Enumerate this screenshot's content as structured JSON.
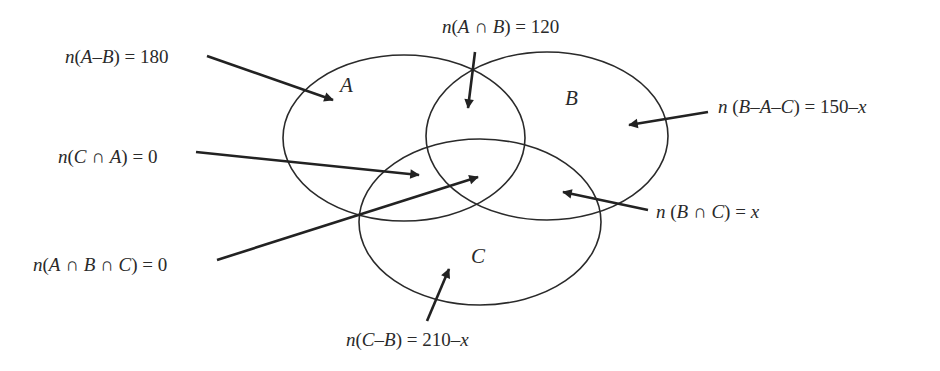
{
  "diagram": {
    "type": "venn",
    "sets": [
      {
        "id": "A",
        "label": "A",
        "cx": 404,
        "cy": 138,
        "rx": 121,
        "ry": 83,
        "label_x": 340,
        "label_y": 92
      },
      {
        "id": "B",
        "label": "B",
        "cx": 547,
        "cy": 136,
        "rx": 121,
        "ry": 84,
        "label_x": 565,
        "label_y": 105
      },
      {
        "id": "C",
        "label": "C",
        "cx": 480,
        "cy": 222,
        "rx": 121,
        "ry": 83,
        "label_x": 471,
        "label_y": 263
      }
    ],
    "annotations": [
      {
        "id": "a-minus-b",
        "text": "n(A–B) = 180",
        "x": 65,
        "y": 63,
        "anchor": "start",
        "line": [
          207,
          56,
          333,
          100
        ]
      },
      {
        "id": "a-inter-b",
        "text": "n(A ∩ B) = 120",
        "x": 442,
        "y": 33,
        "anchor": "start",
        "line": [
          475,
          52,
          468,
          108
        ]
      },
      {
        "id": "b-minus-a-c",
        "text": "n (B–A–C) = 150–x",
        "x": 718,
        "y": 113,
        "anchor": "start",
        "line": [
          708,
          112,
          629,
          125
        ]
      },
      {
        "id": "c-inter-a",
        "text": "n(C ∩ A) = 0",
        "x": 58,
        "y": 163,
        "anchor": "start",
        "line": [
          196,
          152,
          419,
          175
        ]
      },
      {
        "id": "b-inter-c",
        "text": "n (B ∩ C) = x",
        "x": 656,
        "y": 218,
        "anchor": "start",
        "line": [
          648,
          210,
          563,
          192
        ]
      },
      {
        "id": "a-inter-b-inter-c",
        "text": "n(A ∩ B ∩ C) = 0",
        "x": 33,
        "y": 271,
        "anchor": "start",
        "line": [
          217,
          260,
          478,
          177
        ]
      },
      {
        "id": "c-minus-b",
        "text": "n(C–B) = 210–x",
        "x": 346,
        "y": 346,
        "anchor": "start",
        "line": [
          427,
          321,
          449,
          269
        ]
      }
    ]
  }
}
